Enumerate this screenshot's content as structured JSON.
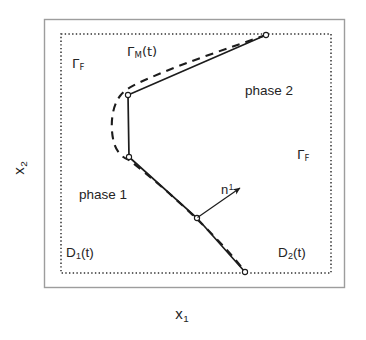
{
  "figure": {
    "type": "schematic-diagram",
    "background_color": "#ffffff",
    "line_color": "#1a1a1a",
    "outer_boundary": {
      "name": "outer-frame",
      "style": "solid",
      "color": "#9a9a9a",
      "x": 44,
      "y": 19,
      "width": 301,
      "height": 269
    },
    "fixed_boundary": {
      "name": "fixed-boundary-gamma-f",
      "style": "dotted",
      "color": "#2a2a2a",
      "x": 61,
      "y": 34,
      "width": 270,
      "height": 239
    },
    "interface": {
      "solid_polyline": [
        [
          266,
          35
        ],
        [
          128,
          95
        ],
        [
          129,
          157
        ],
        [
          197,
          218
        ],
        [
          245,
          272
        ]
      ],
      "dashed_curve_note": "smooth moving interface offset from polyline",
      "nodes": [
        [
          266,
          35
        ],
        [
          128,
          95
        ],
        [
          129,
          157
        ],
        [
          197,
          218
        ],
        [
          245,
          272
        ]
      ]
    },
    "normal_arrow": {
      "from": [
        197,
        218
      ],
      "to": [
        243,
        186
      ],
      "label": "n1"
    }
  },
  "labels": {
    "gamma_m": {
      "greek": "Γ",
      "sub": "M",
      "suffix": "(t)"
    },
    "gamma_f_left": {
      "greek": "Γ",
      "sub": "F"
    },
    "gamma_f_right": {
      "greek": "Γ",
      "sub": "F"
    },
    "phase_2": "phase 2",
    "phase_1": "phase 1",
    "domain_1": {
      "base": "D",
      "sub": "1",
      "suffix": "(t)"
    },
    "domain_2": {
      "base": "D",
      "sub": "2",
      "suffix": "(t)"
    },
    "normal": {
      "base": "n",
      "sup": "1"
    },
    "axis_x1": {
      "base": "x",
      "sub": "1"
    },
    "axis_x2": {
      "base": "x",
      "sub": "2"
    }
  }
}
